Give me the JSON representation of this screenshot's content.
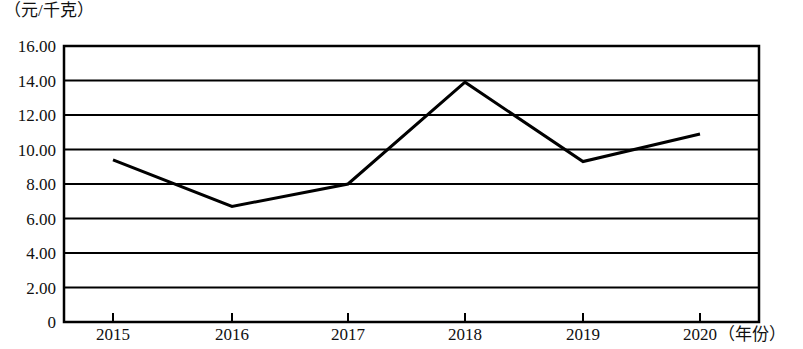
{
  "chart_data": {
    "type": "line",
    "title": "",
    "subtitle": "",
    "xlabel": "（年份）",
    "ylabel": "（元/千克）",
    "categories": [
      "2015",
      "2016",
      "2017",
      "2018",
      "2019",
      "2020"
    ],
    "values": [
      9.4,
      6.7,
      8.0,
      13.9,
      9.3,
      10.9
    ],
    "series": [
      {
        "name": "价格",
        "values": [
          9.4,
          6.7,
          8.0,
          13.9,
          9.3,
          10.9
        ]
      }
    ],
    "ylim": [
      0,
      16
    ],
    "y_ticks": [
      "0",
      "2.00",
      "4.00",
      "6.00",
      "8.00",
      "10.00",
      "12.00",
      "14.00",
      "16.00"
    ],
    "y_tick_values": [
      0,
      2,
      4,
      6,
      8,
      10,
      12,
      14,
      16
    ],
    "grid": "horizontal",
    "legend": "none",
    "line_color": "#000000",
    "frame_color": "#000000",
    "grid_color": "#000000",
    "markers": "none",
    "annotations": []
  },
  "axis": {
    "y_unit_label": "（元/千克）",
    "x_unit_label": "（年份）"
  }
}
